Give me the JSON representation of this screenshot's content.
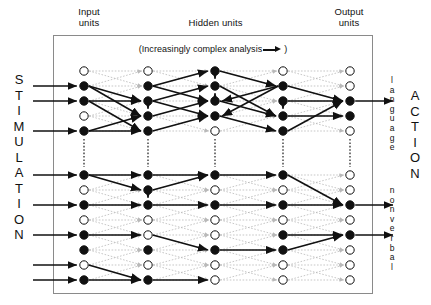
{
  "figure": {
    "type": "neural-network-diagram",
    "headers": {
      "input": "Input\nunits",
      "input_line1": "Input",
      "input_line2": "units",
      "hidden": "Hidden units",
      "output_line1": "Output",
      "output_line2": "units"
    },
    "caption": {
      "prefix": "(Increasingly complex analysis",
      "suffix": ")",
      "arrow_icon": "right-arrow-icon"
    },
    "side_labels": {
      "left": "STIMULATION",
      "right": "ACTION",
      "right_upper_stream": "language",
      "right_lower_stream": "nonverbal"
    },
    "colors": {
      "node_fill": "#111111",
      "node_open": "#ffffff",
      "node_stroke": "#111111",
      "weak_connection": "#b9b9b9",
      "strong_connection": "#111111",
      "frame": "#8a8a8a",
      "text": "#111111"
    },
    "layout": {
      "columns": 5,
      "rows": 11,
      "column_x": [
        84,
        148,
        215,
        283,
        350
      ],
      "row_y": [
        71,
        86,
        101,
        116,
        131,
        153,
        175,
        190,
        205,
        220,
        235
      ],
      "row_y_full": [
        71,
        86,
        101,
        116,
        131,
        146,
        161,
        176,
        191,
        206,
        221,
        236,
        251,
        266,
        281
      ],
      "node_radius": 4.2,
      "separator_rows": "between upper and lower processing streams"
    },
    "legend_semantics": {
      "filled_node": "active unit",
      "open_node": "inactive unit",
      "bold_arrow": "strong weighted connection",
      "dotted_line": "weak connection",
      "vertical_dotted": "stream separator"
    },
    "nodes": {
      "col0": [
        "open",
        "filled",
        "filled",
        "open",
        "filled",
        "filled",
        "sep",
        "filled",
        "open",
        "filled",
        "open",
        "filled",
        "filled"
      ],
      "col1": [
        "open",
        "filled",
        "filled",
        "filled",
        "filled",
        "filled",
        "sep",
        "filled",
        "filled",
        "filled",
        "open",
        "open",
        "filled"
      ],
      "col2": [
        "filled",
        "filled",
        "filled",
        "filled",
        "open",
        "filled",
        "sep",
        "open",
        "filled",
        "open",
        "open",
        "filled",
        "open"
      ],
      "col3": [
        "open",
        "filled",
        "filled",
        "filled",
        "filled",
        "filled",
        "sep",
        "open",
        "filled",
        "open",
        "filled",
        "filled",
        "open"
      ],
      "col4": [
        "open",
        "open",
        "filled",
        "filled",
        "open",
        "open",
        "sep",
        "open",
        "filled",
        "open",
        "filled",
        "open",
        "open"
      ]
    },
    "input_arrow_rows": [
      1,
      2,
      4,
      5,
      7,
      9,
      11,
      12
    ],
    "output_arrow_rows": [
      2,
      8,
      11
    ]
  }
}
